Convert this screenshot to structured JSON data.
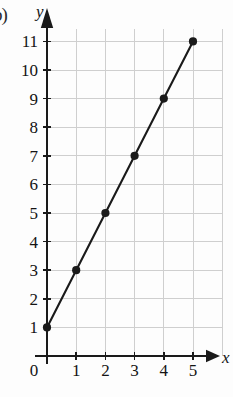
{
  "figure": {
    "part_label": "b)"
  },
  "chart_data": {
    "type": "line",
    "title": "",
    "subtitle": "",
    "xlabel": "x",
    "ylabel": "y",
    "xlim": [
      0,
      5
    ],
    "ylim": [
      0,
      11
    ],
    "grid": true,
    "legend": null,
    "markers": "filled-circle",
    "line_color": "#1a1a1a",
    "grid_color": "#cfcfcf",
    "axis_color": "#1a1a1a",
    "x_ticks": [
      "0",
      "1",
      "2",
      "3",
      "4",
      "5"
    ],
    "y_ticks": [
      "0",
      "1",
      "2",
      "3",
      "4",
      "5",
      "6",
      "7",
      "8",
      "9",
      "10",
      "11"
    ],
    "x": [
      0,
      1,
      2,
      3,
      4,
      5
    ],
    "values": [
      1,
      3,
      5,
      7,
      9,
      11
    ],
    "points": [
      {
        "x": 0,
        "y": 1
      },
      {
        "x": 1,
        "y": 3
      },
      {
        "x": 2,
        "y": 5
      },
      {
        "x": 3,
        "y": 7
      },
      {
        "x": 4,
        "y": 9
      },
      {
        "x": 5,
        "y": 11
      }
    ],
    "series": [
      {
        "name": "",
        "values": [
          1,
          3,
          5,
          7,
          9,
          11
        ]
      }
    ]
  }
}
